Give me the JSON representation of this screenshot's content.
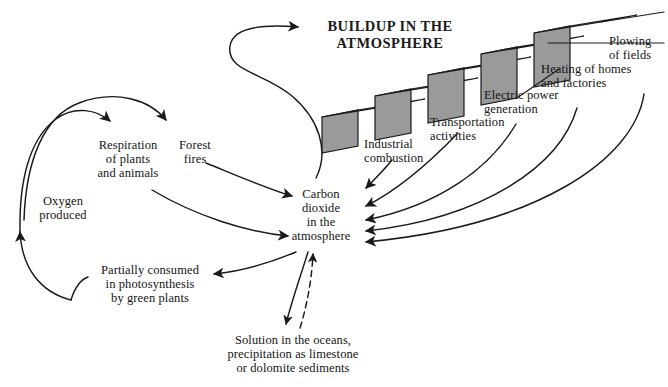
{
  "diagram": {
    "title": "BUILDUP IN THE\nATMOSPHERE",
    "central_node": "Carbon\ndioxide\nin the\natmosphere",
    "colors": {
      "step_front": "#9a9a9a",
      "step_top": "#ffffff",
      "stroke": "#1a1a1a",
      "background": "#ffffff"
    },
    "natural_cycle": [
      {
        "id": "respiration",
        "label": "Respiration\nof plants\nand animals"
      },
      {
        "id": "forest-fires",
        "label": "Forest\nfires"
      },
      {
        "id": "oxygen-produced",
        "label": "Oxygen\nproduced"
      },
      {
        "id": "photosynthesis",
        "label": "Partially consumed\nin photosynthesis\nby green plants"
      },
      {
        "id": "ocean-solution",
        "label": "Solution in the oceans,\nprecipitation as limestone\nor dolomite sediments"
      }
    ],
    "staircase": [
      {
        "id": "industrial-combustion",
        "label": "Industrial\ncombustion"
      },
      {
        "id": "transportation-activities",
        "label": "Transportation\nactivities"
      },
      {
        "id": "electric-power-generation",
        "label": "Electric power\ngeneration"
      },
      {
        "id": "heating-homes-factories",
        "label": "Heating of homes\nand factories"
      },
      {
        "id": "plowing-of-fields",
        "label": "Plowing\nof fields"
      }
    ]
  }
}
